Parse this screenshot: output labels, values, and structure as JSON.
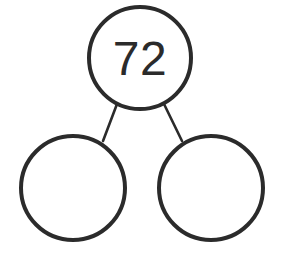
{
  "diagram": {
    "type": "number-bond",
    "background_color": "#ffffff",
    "stroke_color": "#2b2b2b",
    "fill_color": "#ffffff",
    "circle_stroke_width": 4,
    "connector_stroke_width": 2.6,
    "nodes": [
      {
        "id": "whole",
        "role": "whole",
        "label": "72",
        "value": "72",
        "filled": true,
        "cx": 140,
        "cy": 58,
        "r": 51,
        "font_size": 48
      },
      {
        "id": "part-left",
        "role": "part",
        "label": "",
        "value": "",
        "filled": false,
        "cx": 73,
        "cy": 188,
        "r": 52,
        "font_size": 48
      },
      {
        "id": "part-right",
        "role": "part",
        "label": "",
        "value": "",
        "filled": false,
        "cx": 211,
        "cy": 188,
        "r": 52,
        "font_size": 48
      }
    ],
    "connectors": [
      {
        "id": "connector-left",
        "from": "whole",
        "to": "part-left",
        "x1": 117,
        "y1": 104,
        "x2": 103,
        "y2": 141
      },
      {
        "id": "connector-right",
        "from": "whole",
        "to": "part-right",
        "x1": 164,
        "y1": 104,
        "x2": 182,
        "y2": 141
      }
    ]
  }
}
